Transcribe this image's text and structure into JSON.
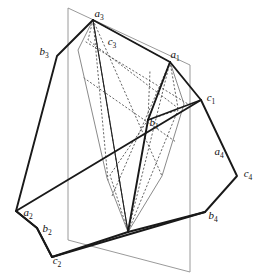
{
  "figure": {
    "background_color": "#ffffff",
    "stroke_dark": "#1a1a1a",
    "stroke_thin": "#8c8c8c",
    "stroke_dotted": "#4d4d4d"
  },
  "labels": [
    {
      "id": "a3",
      "base": "a",
      "sub": "3",
      "x": 99,
      "y": 17,
      "anchor": "middle"
    },
    {
      "id": "c3",
      "base": "c",
      "sub": "3",
      "x": 112,
      "y": 45,
      "anchor": "middle"
    },
    {
      "id": "a1",
      "base": "a",
      "sub": "1",
      "x": 175,
      "y": 58,
      "anchor": "middle"
    },
    {
      "id": "b3",
      "base": "b",
      "sub": "3",
      "x": 44,
      "y": 55,
      "anchor": "middle"
    },
    {
      "id": "c1",
      "base": "c",
      "sub": "1",
      "x": 211,
      "y": 101,
      "anchor": "middle"
    },
    {
      "id": "b1",
      "base": "b",
      "sub": "1",
      "x": 154,
      "y": 126,
      "anchor": "middle"
    },
    {
      "id": "a4",
      "base": "a",
      "sub": "4",
      "x": 219,
      "y": 155,
      "anchor": "middle"
    },
    {
      "id": "c4",
      "base": "c",
      "sub": "4",
      "x": 248,
      "y": 177,
      "anchor": "middle"
    },
    {
      "id": "a2",
      "base": "a",
      "sub": "2",
      "x": 28,
      "y": 216,
      "anchor": "middle"
    },
    {
      "id": "b2",
      "base": "b",
      "sub": "2",
      "x": 47,
      "y": 232,
      "anchor": "middle"
    },
    {
      "id": "b4",
      "base": "b",
      "sub": "4",
      "x": 213,
      "y": 219,
      "anchor": "middle"
    },
    {
      "id": "c2",
      "base": "c",
      "sub": "2",
      "x": 57,
      "y": 264,
      "anchor": "middle"
    }
  ],
  "vertices": {
    "a3": [
      93,
      20
    ],
    "b3": [
      57,
      56
    ],
    "a1": [
      170,
      62
    ],
    "c1": [
      201,
      100
    ],
    "b1": [
      148,
      120
    ],
    "c4": [
      237,
      176
    ],
    "b4": [
      205,
      212
    ],
    "a2": [
      16,
      211
    ],
    "b2": [
      37,
      228
    ],
    "c2": [
      52,
      257
    ],
    "apex": [
      128,
      232
    ],
    "plane_tl": [
      68,
      8
    ],
    "plane_tr": [
      190,
      65
    ],
    "plane_bl": [
      68,
      240
    ],
    "plane_br": [
      190,
      272
    ]
  },
  "paths": {
    "plane_outline": "M68,8 L190,65 L190,272 L68,240 Z",
    "hull_left": "M93,20 L57,56 L16,211 L37,228 L52,257 L128,232 Z",
    "hull_right": "M170,62 L201,100 L237,176 L205,212 L128,232 L148,120 Z",
    "top_ridge": "M93,20 L170,62",
    "long_diagonal": "M16,211 L201,100",
    "bottom_chord": "M52,257 L205,212",
    "a3_fan_1": "M93,20 L80,50",
    "a3_fan_2": "M93,20 L128,232",
    "a3_fan_3": "M93,20 L110,120",
    "a1_fan_1": "M170,62 L148,120",
    "a1_fan_2": "M170,62 L128,232",
    "a1_fan_3": "M170,62 L178,110",
    "inner_left_edge": "M80,50 L110,175",
    "inner_right_edge": "M178,110 L160,180",
    "dotted_kite_upper": "M93,20 L88,40 L178,108 L170,62 Z",
    "dotted_kite_lower": "M148,120 L110,175 L128,232 L178,110 Z",
    "dotted_band_1": "M88,40 L186,104",
    "dotted_band_2": "M84,75 L176,140",
    "dotted_long_left": "M93,20 L110,178",
    "dotted_long_right": "M170,62 L115,200",
    "dotted_cross": "M93,20 L160,180"
  },
  "polygons": {
    "left_body": [
      [
        93,
        20
      ],
      [
        57,
        56
      ],
      [
        16,
        211
      ],
      [
        37,
        228
      ],
      [
        52,
        257
      ],
      [
        128,
        232
      ]
    ],
    "right_body": [
      [
        170,
        62
      ],
      [
        201,
        100
      ],
      [
        237,
        176
      ],
      [
        205,
        212
      ],
      [
        128,
        232
      ],
      [
        148,
        120
      ]
    ]
  }
}
